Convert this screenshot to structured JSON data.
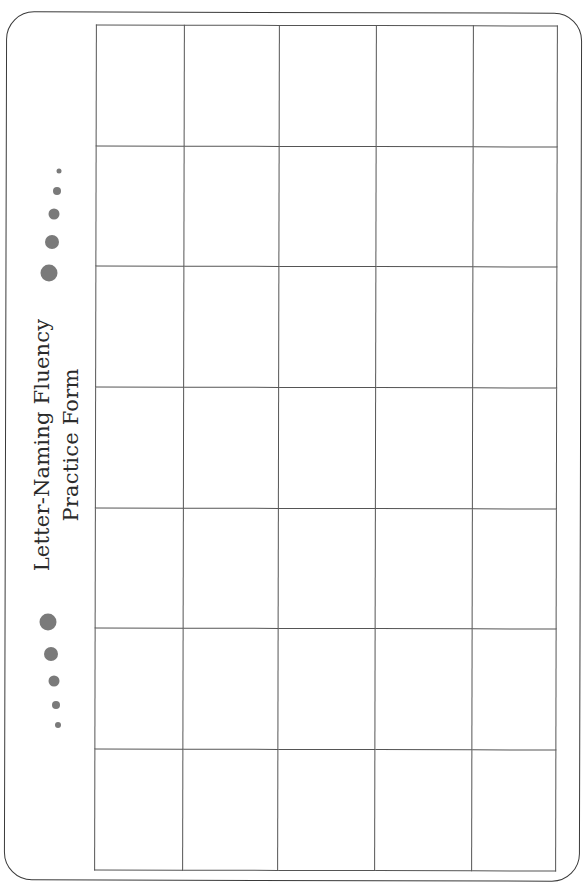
{
  "form": {
    "title_line1": "Letter-Naming Fluency",
    "title_line2": "Practice Form"
  },
  "decoration": {
    "dot_color": "#7a7a7a",
    "top_dots_count": 5,
    "bottom_dots_count": 5
  },
  "grid": {
    "columns": 5,
    "rows": 7,
    "cells": [
      [
        "",
        "",
        "",
        "",
        ""
      ],
      [
        "",
        "",
        "",
        "",
        ""
      ],
      [
        "",
        "",
        "",
        "",
        ""
      ],
      [
        "",
        "",
        "",
        "",
        ""
      ],
      [
        "",
        "",
        "",
        "",
        ""
      ],
      [
        "",
        "",
        "",
        "",
        ""
      ],
      [
        "",
        "",
        "",
        "",
        ""
      ]
    ]
  }
}
